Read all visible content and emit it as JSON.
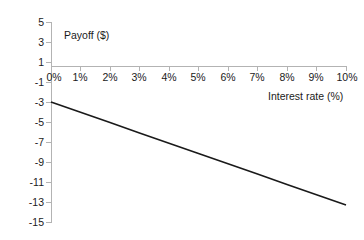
{
  "chart_data": {
    "type": "line",
    "title": "",
    "xlabel": "Interest rate (%)",
    "ylabel": "Payoff ($)",
    "xlim": [
      0,
      10
    ],
    "ylim": [
      -15,
      5
    ],
    "grid": false,
    "legend": "none",
    "x_tick_labels": [
      "0%",
      "1%",
      "2%",
      "3%",
      "4%",
      "5%",
      "6%",
      "7%",
      "8%",
      "9%",
      "10%"
    ],
    "x_tick_values": [
      0,
      1,
      2,
      3,
      4,
      5,
      6,
      7,
      8,
      9,
      10
    ],
    "y_tick_labels": [
      "5",
      "3",
      "1",
      "-1",
      "-3",
      "-5",
      "-7",
      "-9",
      "-11",
      "-13",
      "-15"
    ],
    "y_tick_values": [
      5,
      3,
      1,
      -1,
      -3,
      -5,
      -7,
      -9,
      -11,
      -13,
      -15
    ],
    "series": [
      {
        "name": "Payoff",
        "color": "#1a1a1a",
        "x": [
          0,
          1,
          2,
          3,
          4,
          5,
          6,
          7,
          8,
          9,
          10
        ],
        "values": [
          -3.0,
          -4.03,
          -5.06,
          -6.09,
          -7.12,
          -8.15,
          -9.18,
          -10.21,
          -11.24,
          -12.27,
          -13.3
        ]
      }
    ]
  },
  "axes": {
    "y_title": "Payoff ($)",
    "x_title": "Interest rate (%)"
  },
  "colors": {
    "axis": "#b3b3b3",
    "series": "#1a1a1a",
    "text": "#1a1a1a",
    "background": "#ffffff"
  }
}
